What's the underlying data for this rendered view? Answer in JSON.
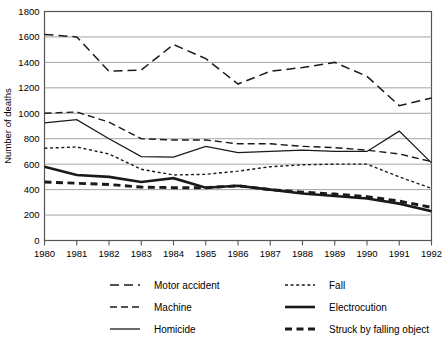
{
  "chart_data": {
    "type": "line",
    "title": "",
    "xlabel": "",
    "ylabel": "Number of deaths",
    "xlim": [
      1980,
      1992
    ],
    "ylim": [
      0,
      1800
    ],
    "ytick_step": 200,
    "grid": true,
    "legend_position": "below",
    "categories": [
      1980,
      1981,
      1982,
      1983,
      1984,
      1985,
      1986,
      1987,
      1988,
      1989,
      1990,
      1991,
      1992
    ],
    "xticklabels": [
      "1980",
      "1981",
      "1982",
      "1983",
      "1984",
      "1985",
      "1986",
      "1987",
      "1988",
      "1989",
      "1990",
      "1991",
      "1992"
    ],
    "yticklabels": [
      "0",
      "200",
      "400",
      "600",
      "800",
      "1000",
      "1200",
      "1400",
      "1600",
      "1800"
    ],
    "yticks": [
      0,
      200,
      400,
      600,
      800,
      1000,
      1200,
      1400,
      1600,
      1800
    ],
    "series": [
      {
        "name": "Motor accident",
        "style": "long-dash",
        "values": [
          1620,
          1600,
          1330,
          1340,
          1540,
          1430,
          1230,
          1330,
          1360,
          1400,
          1290,
          1060,
          1120
        ]
      },
      {
        "name": "Machine",
        "style": "medium-dash",
        "values": [
          1000,
          1010,
          930,
          800,
          790,
          790,
          760,
          760,
          740,
          730,
          710,
          680,
          620
        ]
      },
      {
        "name": "Homicide",
        "style": "solid-thin",
        "values": [
          925,
          950,
          800,
          660,
          655,
          740,
          690,
          700,
          710,
          700,
          700,
          860,
          610
        ]
      },
      {
        "name": "Fall",
        "style": "fine-dot",
        "values": [
          725,
          735,
          680,
          560,
          515,
          520,
          545,
          580,
          595,
          600,
          600,
          500,
          410
        ]
      },
      {
        "name": "Electrocution",
        "style": "solid-thick",
        "values": [
          580,
          515,
          500,
          460,
          490,
          415,
          430,
          400,
          370,
          350,
          330,
          290,
          230
        ]
      },
      {
        "name": "Struck by falling object",
        "style": "thick-dash",
        "values": [
          460,
          450,
          440,
          420,
          415,
          415,
          430,
          400,
          380,
          365,
          345,
          310,
          260
        ]
      }
    ]
  },
  "legend": {
    "items": [
      {
        "label": "Motor accident",
        "style": "long-dash",
        "column": 0,
        "row": 0
      },
      {
        "label": "Machine",
        "style": "medium-dash",
        "column": 0,
        "row": 1
      },
      {
        "label": "Homicide",
        "style": "solid-thin",
        "column": 0,
        "row": 2
      },
      {
        "label": "Fall",
        "style": "fine-dot",
        "column": 1,
        "row": 0
      },
      {
        "label": "Electrocution",
        "style": "solid-thick",
        "column": 1,
        "row": 1
      },
      {
        "label": "Struck by falling object",
        "style": "thick-dash",
        "column": 1,
        "row": 2
      }
    ]
  },
  "colors": {
    "line": "#1a1a1a",
    "grid": "#9a9a9a",
    "axis": "#555555",
    "background": "#ffffff"
  }
}
